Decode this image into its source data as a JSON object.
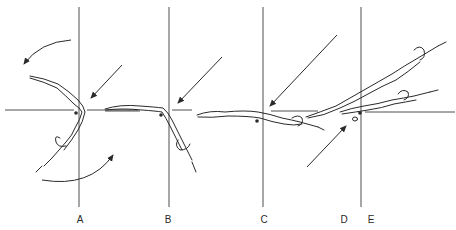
{
  "diagram": {
    "type": "swimming-dive-entry-sequence",
    "colors": {
      "line": "#3a3a3a",
      "figure": "#2a2a2a",
      "background": "#ffffff"
    },
    "phases": [
      {
        "id": "A",
        "label": "A",
        "x": 80
      },
      {
        "id": "B",
        "label": "B",
        "x": 168
      },
      {
        "id": "C",
        "label": "C",
        "x": 264
      },
      {
        "id": "D",
        "label": "D",
        "x": 344
      },
      {
        "id": "E",
        "label": "E",
        "x": 371
      }
    ],
    "reference_lines": {
      "vertical_x": [
        79,
        169,
        263,
        361
      ],
      "vertical_y_range": [
        7,
        207
      ],
      "horizontal_y": 110
    },
    "arrows": [
      {
        "name": "rotation-arrow-top",
        "type": "curved"
      },
      {
        "name": "rotation-arrow-bottom",
        "type": "curved"
      },
      {
        "name": "force-arrow-a",
        "type": "straight"
      },
      {
        "name": "force-arrow-b",
        "type": "straight"
      },
      {
        "name": "force-arrow-c",
        "type": "straight"
      },
      {
        "name": "force-arrow-de",
        "type": "straight"
      }
    ]
  }
}
